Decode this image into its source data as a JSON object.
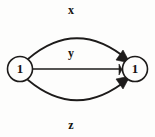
{
  "diagram": {
    "type": "directed-multigraph",
    "background_color": "#fdfdfc",
    "stroke_color": "#1d1b1a",
    "nodes": [
      {
        "id": "source",
        "label": "1",
        "cx": 20,
        "cy": 69,
        "r": 12.5
      },
      {
        "id": "target",
        "label": "1",
        "cx": 135,
        "cy": 69,
        "r": 12.5
      }
    ],
    "edges": [
      {
        "id": "edge-x",
        "label": "x",
        "shape": "curve-above",
        "from": "source",
        "to": "target",
        "label_x": 71,
        "label_y": 11,
        "path": "M 28 59 Q 77 17 128 60",
        "arrow": "123,50 130,63 116,60"
      },
      {
        "id": "edge-y",
        "label": "y",
        "shape": "straight",
        "from": "source",
        "to": "target",
        "label_x": 71,
        "label_y": 54,
        "path": "M 33 69 L 120 69",
        "arrow": "119,64 122,69.5 119,75"
      },
      {
        "id": "edge-z",
        "label": "z",
        "shape": "curve-below",
        "from": "source",
        "to": "target",
        "label_x": 71,
        "label_y": 126,
        "path": "M 28 80 Q 77 121 128 79",
        "arrow": "123,89 130,76 116,79"
      }
    ]
  }
}
